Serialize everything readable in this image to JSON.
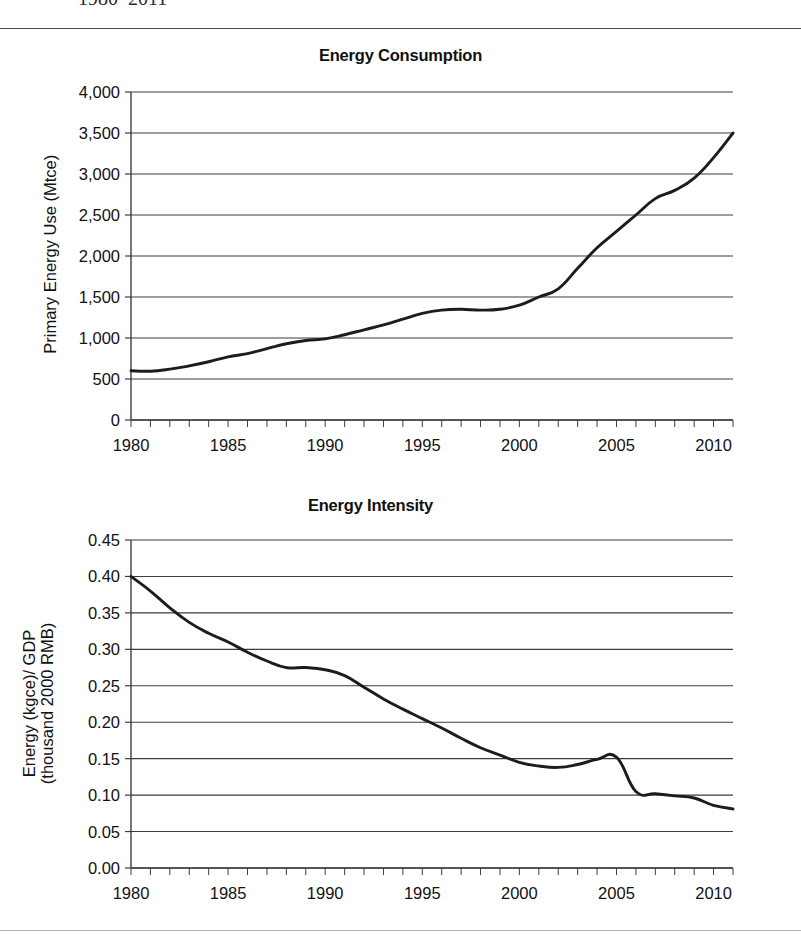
{
  "caption_fragment": "1980–2011",
  "charts": [
    {
      "id": "energy-consumption",
      "title": "Energy Consumption",
      "ylabel_lines": [
        "Primary Energy Use (Mtce)"
      ],
      "ytick_labels": [
        "0",
        "500",
        "1,000",
        "1,500",
        "2,000",
        "2,500",
        "3,000",
        "3,500",
        "4,000"
      ],
      "xtick_labels": [
        "1980",
        "1985",
        "1990",
        "1995",
        "2000",
        "2005",
        "2010"
      ]
    },
    {
      "id": "energy-intensity",
      "title": "Energy Intensity",
      "ylabel_lines": [
        "Energy (kgce)/ GDP",
        "(thousand 2000 RMB)"
      ],
      "ytick_labels": [
        "0.00",
        "0.05",
        "0.10",
        "0.15",
        "0.20",
        "0.25",
        "0.30",
        "0.35",
        "0.40",
        "0.45"
      ],
      "xtick_labels": [
        "1980",
        "1985",
        "1990",
        "1995",
        "2000",
        "2005",
        "2010"
      ]
    }
  ],
  "chart_data": [
    {
      "type": "line",
      "title": "Energy Consumption",
      "xlabel": "",
      "ylabel": "Primary Energy Use (Mtce)",
      "xlim": [
        1980,
        2011
      ],
      "ylim": [
        0,
        4000
      ],
      "ytick_step": 500,
      "xtick_step": 5,
      "xminor_step": 1,
      "grid": "horizontal",
      "legend": "none",
      "line_color": "#1c1c1c",
      "x": [
        1980,
        1981,
        1982,
        1983,
        1984,
        1985,
        1986,
        1987,
        1988,
        1989,
        1990,
        1991,
        1992,
        1993,
        1994,
        1995,
        1996,
        1997,
        1998,
        1999,
        2000,
        2001,
        2002,
        2003,
        2004,
        2005,
        2006,
        2007,
        2008,
        2009,
        2010,
        2011
      ],
      "values": [
        600,
        595,
        620,
        660,
        710,
        770,
        810,
        870,
        930,
        970,
        990,
        1040,
        1100,
        1160,
        1230,
        1300,
        1340,
        1350,
        1340,
        1350,
        1400,
        1500,
        1600,
        1850,
        2100,
        2300,
        2500,
        2700,
        2800,
        2950,
        3200,
        3500
      ],
      "series_name": "Primary energy use"
    },
    {
      "type": "line",
      "title": "Energy Intensity",
      "xlabel": "",
      "ylabel": "Energy (kgce)/ GDP (thousand 2000 RMB)",
      "xlim": [
        1980,
        2011
      ],
      "ylim": [
        0.0,
        0.45
      ],
      "ytick_step": 0.05,
      "xtick_step": 5,
      "xminor_step": 1,
      "grid": "horizontal",
      "legend": "none",
      "line_color": "#1c1c1c",
      "x": [
        1980,
        1981,
        1982,
        1983,
        1984,
        1985,
        1986,
        1987,
        1988,
        1989,
        1990,
        1991,
        1992,
        1993,
        1994,
        1995,
        1996,
        1997,
        1998,
        1999,
        2000,
        2001,
        2002,
        2003,
        2004,
        2005,
        2006,
        2007,
        2008,
        2009,
        2010,
        2011
      ],
      "values": [
        0.4,
        0.38,
        0.357,
        0.337,
        0.322,
        0.31,
        0.296,
        0.284,
        0.275,
        0.275,
        0.272,
        0.264,
        0.248,
        0.232,
        0.218,
        0.205,
        0.192,
        0.178,
        0.165,
        0.155,
        0.145,
        0.14,
        0.138,
        0.142,
        0.149,
        0.152,
        0.105,
        0.102,
        0.099,
        0.096,
        0.086,
        0.081
      ],
      "series_name": "Energy intensity"
    }
  ]
}
